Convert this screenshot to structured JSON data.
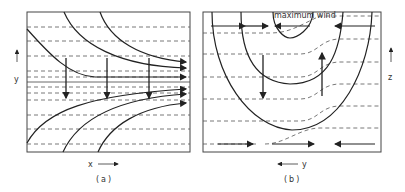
{
  "panels": [
    {
      "id": "a",
      "caption": "(a)",
      "x_axis_label": "x",
      "y_axis_label": "y",
      "description": "Confluent streamlines (solid) converging toward a horizontal axis with dashed isentropes; downward arrows indicate vertical motion"
    },
    {
      "id": "b",
      "caption": "(b)",
      "x_axis_label": "y",
      "y_axis_label": "z",
      "annotation": "maximum wind",
      "description": "Cross-section with nested U-shaped isotachs (solid), dashed isentropes, down/up vertical motion arrows and opposing horizontal arrows top and bottom"
    }
  ],
  "colors": {
    "line": "#222222",
    "dashed": "#555555",
    "background": "#ffffff"
  }
}
